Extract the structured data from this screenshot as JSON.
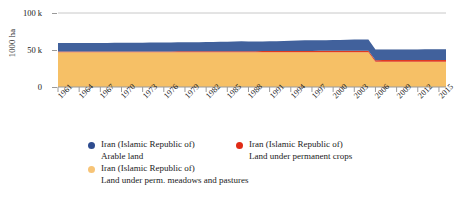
{
  "chart_data": {
    "type": "area",
    "stacked": true,
    "title": "",
    "subtitle": "",
    "xlabel": "",
    "ylabel": "1000 ha",
    "grid": true,
    "grid_lines_y": [
      100000
    ],
    "legend_position": "bottom",
    "ylim": [
      0,
      100000
    ],
    "ytick_labels": [
      "0",
      "50 k",
      "100 k"
    ],
    "ytick_values": [
      0,
      50000,
      100000
    ],
    "xlim": [
      1961,
      2016
    ],
    "xtick_labels": [
      "1961",
      "1964",
      "1967",
      "1970",
      "1973",
      "1976",
      "1979",
      "1982",
      "1985",
      "1988",
      "1991",
      "1994",
      "1997",
      "2000",
      "2003",
      "2006",
      "2009",
      "2012",
      "2015"
    ],
    "xtick_values": [
      1961,
      1964,
      1967,
      1970,
      1973,
      1976,
      1979,
      1982,
      1985,
      1988,
      1991,
      1994,
      1997,
      2000,
      2003,
      2006,
      2009,
      2012,
      2015
    ],
    "x": [
      1961,
      1962,
      1963,
      1964,
      1965,
      1966,
      1967,
      1968,
      1969,
      1970,
      1971,
      1972,
      1973,
      1974,
      1975,
      1976,
      1977,
      1978,
      1979,
      1980,
      1981,
      1982,
      1983,
      1984,
      1985,
      1986,
      1987,
      1988,
      1989,
      1990,
      1991,
      1992,
      1993,
      1994,
      1995,
      1996,
      1997,
      1998,
      1999,
      2000,
      2001,
      2002,
      2003,
      2004,
      2005,
      2006,
      2007,
      2008,
      2009,
      2010,
      2011,
      2012,
      2013,
      2014,
      2015,
      2016
    ],
    "series": [
      {
        "name": "Iran (Islamic Republic of) Land under perm. meadows and pastures",
        "short_name": "Land under perm. meadows and pastures",
        "color": "#f6c066",
        "stack_order": 1,
        "values": [
          46800,
          46800,
          46800,
          46800,
          46800,
          46800,
          46800,
          46800,
          46800,
          46800,
          46800,
          46800,
          46800,
          46800,
          46800,
          46800,
          46800,
          46800,
          46800,
          46800,
          46800,
          46800,
          46800,
          46800,
          46800,
          46800,
          46800,
          46800,
          46800,
          46800,
          46800,
          46800,
          46800,
          46800,
          46800,
          46800,
          46800,
          46800,
          46800,
          46800,
          46800,
          46800,
          46800,
          46800,
          46800,
          34000,
          34000,
          34000,
          34000,
          34000,
          34000,
          34000,
          34000,
          34000,
          34000,
          34000
        ]
      },
      {
        "name": "Iran (Islamic Republic of) Land under permanent crops",
        "short_name": "Land under permanent crops",
        "color": "#e03a20",
        "stack_order": 2,
        "values": [
          1100,
          1110,
          1120,
          1130,
          1140,
          1150,
          1160,
          1170,
          1180,
          1200,
          1220,
          1240,
          1260,
          1280,
          1300,
          1320,
          1340,
          1360,
          1380,
          1400,
          1430,
          1460,
          1490,
          1520,
          1550,
          1580,
          1610,
          1640,
          1670,
          1700,
          1740,
          1780,
          1820,
          1860,
          1900,
          1940,
          1980,
          2020,
          2060,
          2100,
          2140,
          2180,
          2220,
          2260,
          2300,
          2300,
          2320,
          2340,
          2360,
          2380,
          2400,
          2420,
          2440,
          2460,
          2480,
          2500
        ]
      },
      {
        "name": "Iran (Islamic Republic of) Arable land",
        "short_name": "Arable land",
        "color": "#41619c",
        "stack_order": 3,
        "values": [
          11500,
          11500,
          11500,
          11500,
          11550,
          11600,
          11600,
          11650,
          11700,
          11700,
          11750,
          11800,
          11850,
          11900,
          11950,
          12000,
          12100,
          12200,
          12300,
          12300,
          12400,
          12500,
          12600,
          12700,
          12800,
          13100,
          13400,
          13200,
          13000,
          13100,
          13200,
          13400,
          13600,
          13900,
          14200,
          14400,
          14300,
          14200,
          14300,
          14500,
          14700,
          14900,
          15100,
          15200,
          15000,
          14500,
          14400,
          14300,
          14300,
          14400,
          14400,
          14400,
          14450,
          14500,
          14500,
          14500
        ]
      }
    ]
  },
  "axes": {
    "y_title": "1000 ha",
    "y_ticks": [
      {
        "label": "100 k",
        "value": 100000
      },
      {
        "label": "50 k",
        "value": 50000
      },
      {
        "label": "0",
        "value": 0
      }
    ],
    "x_ticks": [
      {
        "label": "1961"
      },
      {
        "label": "1964"
      },
      {
        "label": "1967"
      },
      {
        "label": "1970"
      },
      {
        "label": "1973"
      },
      {
        "label": "1976"
      },
      {
        "label": "1979"
      },
      {
        "label": "1982"
      },
      {
        "label": "1985"
      },
      {
        "label": "1988"
      },
      {
        "label": "1991"
      },
      {
        "label": "1994"
      },
      {
        "label": "1997"
      },
      {
        "label": "2000"
      },
      {
        "label": "2003"
      },
      {
        "label": "2006"
      },
      {
        "label": "2009"
      },
      {
        "label": "2012"
      },
      {
        "label": "2015"
      }
    ]
  },
  "legend": {
    "entries": [
      {
        "country": "Iran (Islamic Republic of)",
        "measure": "Arable land",
        "color": "#2e4c8f"
      },
      {
        "country": "Iran (Islamic Republic of)",
        "measure": "Land under permanent crops",
        "color": "#e02b16"
      },
      {
        "country": "Iran (Islamic Republic of)",
        "measure": "Land under perm. meadows and pastures",
        "color": "#f7c477"
      }
    ]
  },
  "colors": {
    "arable": "#41619c",
    "permanent_crops": "#e03a20",
    "meadows_pastures": "#f6c066",
    "gridline": "#c8c8c8",
    "axis": "#9a9a9a",
    "text": "#1a1a1a",
    "background": "#ffffff"
  }
}
